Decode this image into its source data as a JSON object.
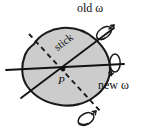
{
  "figure": {
    "background_color": "#ffffff",
    "labels": {
      "old_omega": "old ω",
      "new_omega": "new ω",
      "stick": "stick",
      "point": "P"
    },
    "colors": {
      "body_fill": "#cccccc",
      "body_stroke": "#1a1a1a",
      "axis_line": "#111111",
      "dashed_line": "#1a1a1a",
      "arrow": "#1a1a1a",
      "text": "#111111"
    },
    "geometry": {
      "blob_center": {
        "x": 64,
        "y": 70
      },
      "point_p": {
        "x": 63,
        "y": 69
      },
      "old_omega_axis": {
        "angle_deg": -37,
        "description": "solid diagonal line through P toward upper right"
      },
      "new_omega_axis": {
        "angle_deg": 4,
        "description": "solid near-horizontal line through P toward right"
      },
      "dashed_axis": {
        "angle_deg": 53,
        "description": "dashed line through P from upper left to lower right"
      }
    },
    "elements": [
      {
        "name": "body-blob",
        "type": "filled-irregular-polygon"
      },
      {
        "name": "old-omega-axis-line",
        "type": "solid-line"
      },
      {
        "name": "new-omega-axis-line",
        "type": "solid-line"
      },
      {
        "name": "dashed-axis-line",
        "type": "dashed-line"
      },
      {
        "name": "old-omega-rotation-arrow",
        "type": "curved-spiral-arrow"
      },
      {
        "name": "new-omega-rotation-arrow",
        "type": "curved-spiral-arrow"
      },
      {
        "name": "dashed-axis-rotation-arrow",
        "type": "curved-spiral-arrow"
      },
      {
        "name": "point-p-marker",
        "type": "dot"
      }
    ]
  }
}
